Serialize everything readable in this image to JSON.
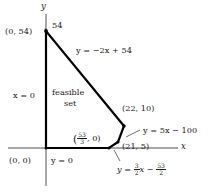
{
  "figure": {
    "kind": "feasible-set-diagram",
    "axis_labels": {
      "x": "x",
      "y": "y"
    },
    "colors": {
      "axis": "#3a3a3a",
      "polygon": "#000000",
      "text": "#1a1a1a",
      "background": "#ffffff"
    },
    "origin_px": {
      "x": 46,
      "y": 148
    },
    "axis_extent_px": {
      "x_min": 8,
      "x_max": 178,
      "y_top": 14,
      "y_bottom": 186
    },
    "vertices": [
      {
        "label": "(0, 0)",
        "x": 0,
        "y": 0,
        "px": {
          "x": 46,
          "y": 148
        }
      },
      {
        "label": "(0, 54)",
        "x": 0,
        "y": 54,
        "px": {
          "x": 46,
          "y": 31
        }
      },
      {
        "label": "(22, 10)",
        "x": 22,
        "y": 10,
        "px": {
          "x": 124,
          "y": 126
        }
      },
      {
        "label": "(21, 5)",
        "x": 21,
        "y": 5,
        "px": {
          "x": 118,
          "y": 142
        }
      },
      {
        "label": "(53/3, 0)",
        "x": 17.6667,
        "y": 0,
        "px": {
          "x": 109,
          "y": 148
        }
      }
    ],
    "region_label": {
      "line1": "feasible",
      "line2": "set"
    },
    "tick_label_54": "54",
    "edge_equations": {
      "top": "y = −2x + 54",
      "right_upper": "y = 5x − 100",
      "right_lower_prefix": "y = ",
      "right_lower_frac1_num": "3",
      "right_lower_frac1_den": "2",
      "right_lower_mid": "x − ",
      "right_lower_frac2_num": "53",
      "right_lower_frac2_den": "2",
      "left": "x = 0",
      "bottom": "y = 0"
    },
    "vertex_frac_label": {
      "open": "(",
      "num": "53",
      "den": "3",
      "close": ", 0)"
    }
  }
}
